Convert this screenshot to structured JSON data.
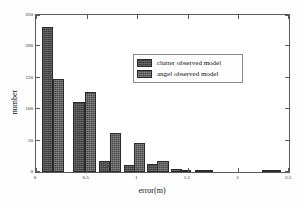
{
  "chart_data": {
    "type": "bar",
    "title": "",
    "xlabel": "error(m)",
    "ylabel": "number",
    "xlim": [
      0,
      2.5
    ],
    "ylim": [
      0,
      250
    ],
    "xticks": [
      0,
      0.5,
      1,
      1.5,
      2,
      2.5
    ],
    "xticklabels": [
      "0",
      "0.5",
      "1",
      "1.5",
      "2",
      "2.5"
    ],
    "yticks": [
      0,
      50,
      100,
      150,
      200,
      250
    ],
    "yticklabels": [
      "0",
      "50",
      "100",
      "150",
      "200",
      "250"
    ],
    "grid": false,
    "legend_position": "upper-center",
    "bin_width": 0.11,
    "series": [
      {
        "name": "clutter observed model",
        "color": "#3b3b3b",
        "x": [
          0.06,
          0.37,
          0.62,
          0.87,
          1.1,
          1.33,
          1.57,
          2.23
        ],
        "values": [
          231,
          112,
          18,
          11,
          12,
          5,
          4,
          3
        ]
      },
      {
        "name": "angel observed model",
        "color": "#4a4a4a",
        "x": [
          0.17,
          0.48,
          0.73,
          0.97,
          1.2,
          1.42,
          1.64,
          2.31
        ],
        "values": [
          148,
          128,
          62,
          46,
          18,
          4,
          3,
          3
        ]
      }
    ]
  },
  "legend": {
    "entries": [
      {
        "label": "clutter observed model"
      },
      {
        "label": "angel observed model"
      }
    ]
  },
  "axes": {
    "x_label": "error(m)",
    "y_label": "number"
  }
}
